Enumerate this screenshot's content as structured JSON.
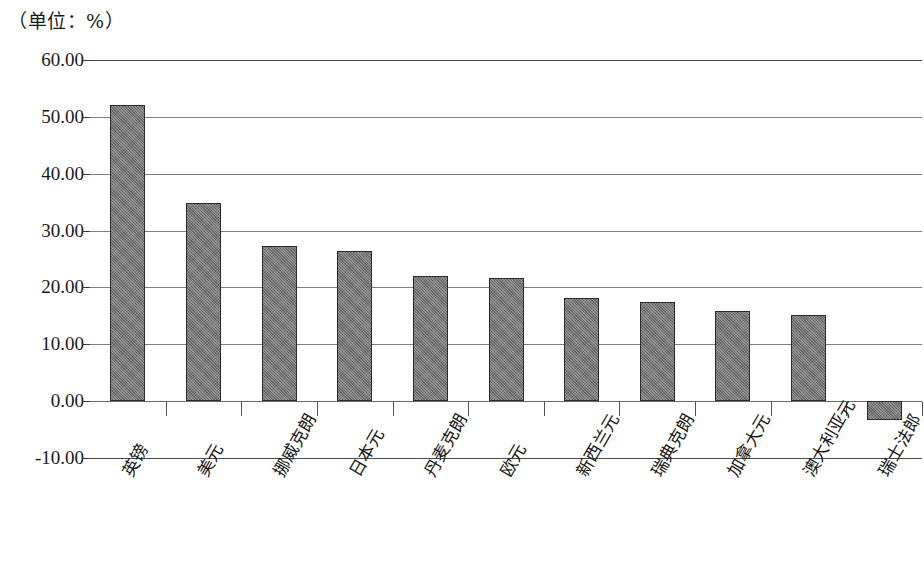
{
  "chart_data": {
    "type": "bar",
    "title": "（单位：%）",
    "xlabel": "",
    "ylabel": "",
    "ylim": [
      -10,
      60
    ],
    "ytick_step": 10,
    "grid": true,
    "legend": null,
    "bar_color": "#767676",
    "bar_border_color": "#2b2b2b",
    "categories": [
      "英镑",
      "美元",
      "挪威克朗",
      "日本元",
      "丹麦克朗",
      "欧元",
      "新西兰元",
      "瑞典克朗",
      "加拿大元",
      "澳大利亚元",
      "瑞士法郎"
    ],
    "values": [
      52.0,
      34.9,
      27.3,
      26.4,
      22.0,
      21.6,
      18.2,
      17.5,
      15.9,
      15.1,
      -3.3
    ],
    "ytick_labels": [
      "60.00",
      "50.00",
      "40.00",
      "30.00",
      "20.00",
      "10.00",
      "0.00",
      "-10.00"
    ],
    "ytick_values": [
      60,
      50,
      40,
      30,
      20,
      10,
      0,
      -10
    ]
  }
}
